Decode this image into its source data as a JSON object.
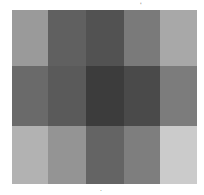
{
  "image": {
    "description": "5x3 grid of grayscale blocks",
    "marks": [
      {
        "text": "'",
        "x": 140,
        "y": 2
      },
      {
        "text": ".",
        "x": 100,
        "y": 186
      }
    ]
  },
  "grid": {
    "rows": 3,
    "cols": 5,
    "cells": [
      [
        "#9a9a9a",
        "#606060",
        "#525252",
        "#7a7a7a",
        "#a8a8a8"
      ],
      [
        "#6a6a6a",
        "#5a5a5a",
        "#3c3c3c",
        "#4a4a4a",
        "#7c7c7c"
      ],
      [
        "#b2b2b2",
        "#949494",
        "#646464",
        "#7e7e7e",
        "#cbcbcb"
      ]
    ]
  }
}
